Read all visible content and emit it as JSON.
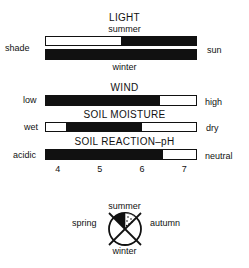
{
  "light": {
    "title": "LIGHT",
    "summer_label": "summer",
    "winter_label": "winter",
    "left_label": "shade",
    "right_label": "sun",
    "summer_range": [
      0.5,
      1.0
    ],
    "winter_range": [
      0.0,
      1.0
    ]
  },
  "wind": {
    "title": "WIND",
    "left_label": "low",
    "right_label": "high",
    "range": [
      0.0,
      0.76
    ]
  },
  "soil_moisture": {
    "title": "SOIL MOISTURE",
    "left_label": "wet",
    "right_label": "dry",
    "range": [
      0.13,
      0.64
    ]
  },
  "soil_ph": {
    "title": "SOIL REACTION–pH",
    "left_label": "acidic",
    "right_label": "neutral",
    "scale": [
      3.7,
      7.3
    ],
    "range_ph": [
      3.7,
      6.5
    ],
    "ticks": [
      "4",
      "5",
      "6",
      "7"
    ]
  },
  "season_wheel": {
    "labels": {
      "top": "summer",
      "left": "spring",
      "right": "autumn",
      "bottom": "winter"
    },
    "highlight": "summer"
  }
}
